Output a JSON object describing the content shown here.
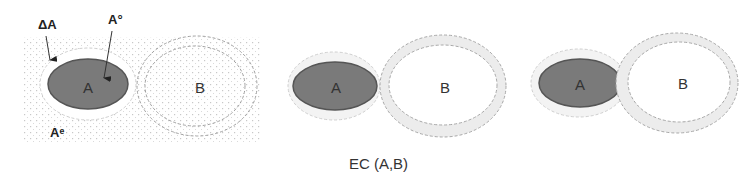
{
  "diagram": {
    "panels": [
      {
        "id": "panel-1",
        "labels": {
          "region_a": "A",
          "region_b": "B",
          "boundary": "ΔA",
          "interior": "A°",
          "exterior": "Aᵉ"
        }
      },
      {
        "id": "panel-2",
        "labels": {
          "region_a": "A",
          "region_b": "B"
        }
      },
      {
        "id": "panel-3",
        "labels": {
          "region_a": "A",
          "region_b": "B"
        }
      }
    ],
    "caption": "EC (A,B)",
    "colors": {
      "interior_fill": "#7a7a7a",
      "interior_stroke": "#555555",
      "boundary_ring": "#e6e6e6",
      "grid_dot": "#c8c8c8",
      "dashed_stroke": "#999999"
    }
  }
}
